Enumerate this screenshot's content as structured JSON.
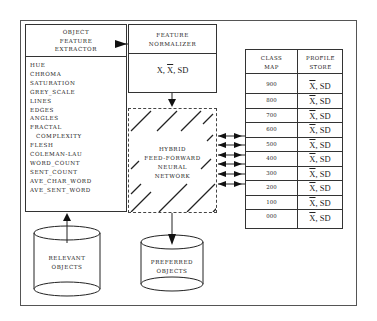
{
  "diagram": {
    "extractor": {
      "title_lines": [
        "OBJECT",
        "FEATURE",
        "EXTRACTOR"
      ],
      "features": [
        "HUE",
        "CHROMA",
        "SATURATION",
        "GREY_SCALE",
        "LINES",
        "EDGES",
        "ANGLES",
        "FRACTAL",
        "COMPLEXITY",
        "FLESH",
        "COLEMAN-LAU",
        "WORD_COUNT",
        "SENT_COUNT",
        "AVE_CHAR_WORD",
        "AVE_SENT_WORD"
      ]
    },
    "normalizer": {
      "title_lines": [
        "FEATURE",
        "NORMALIZER"
      ],
      "stat_x": "X",
      "sep1": ", ",
      "stat_xbar": "X",
      "sep2": ", ",
      "stat_sd": "SD"
    },
    "network": {
      "label_lines": [
        "HYBRID",
        "FEED-FORWARD",
        "NEURAL",
        "NETWORK"
      ]
    },
    "relevant_store": {
      "label_lines": [
        "RELEVANT",
        "OBJECTS"
      ]
    },
    "preferred_store": {
      "label_lines": [
        "PREFERRED",
        "OBJECTS"
      ]
    },
    "table": {
      "headers": [
        {
          "lines": [
            "CLASS",
            "MAP"
          ]
        },
        {
          "lines": [
            "PROFILE",
            "STORE"
          ]
        }
      ],
      "rows": [
        {
          "class": "900",
          "xbar": "X",
          "sep": ", ",
          "sd": "SD"
        },
        {
          "class": "800",
          "xbar": "X",
          "sep": ", ",
          "sd": "SD"
        },
        {
          "class": "700",
          "xbar": "X",
          "sep": ", ",
          "sd": "SD"
        },
        {
          "class": "600",
          "xbar": "X",
          "sep": ", ",
          "sd": "SD"
        },
        {
          "class": "500",
          "xbar": "X",
          "sep": ", ",
          "sd": "SD"
        },
        {
          "class": "400",
          "xbar": "X",
          "sep": ", ",
          "sd": "SD"
        },
        {
          "class": "300",
          "xbar": "X",
          "sep": ", ",
          "sd": "SD"
        },
        {
          "class": "200",
          "xbar": "X",
          "sep": ", ",
          "sd": "SD"
        },
        {
          "class": "100",
          "xbar": "X",
          "sep": ", ",
          "sd": "SD"
        },
        {
          "class": "000",
          "xbar": "X",
          "sep": ", ",
          "sd": "SD"
        }
      ]
    },
    "colors": {
      "line": "#333333",
      "frame": "#555555",
      "background": "#ffffff"
    }
  }
}
